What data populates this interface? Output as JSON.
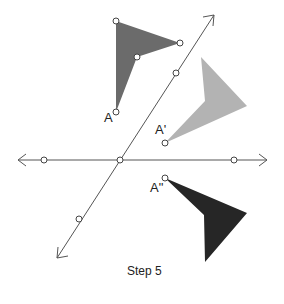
{
  "caption": "Step 5",
  "labels": {
    "a": "A",
    "a_prime": "A'",
    "a_double_prime": "A\""
  },
  "colors": {
    "original_shape": "#6b6b6b",
    "first_image": "#b3b3b3",
    "second_image": "#262626",
    "lines": "#555555"
  },
  "shapes": {
    "original": {
      "points": "116,21 180,43 137,57 116,112"
    },
    "first_reflection": {
      "points": "201,57 247,106 165,143 205,101"
    },
    "second_reflection": {
      "points": "165,178 247,213 205,262 204,215"
    }
  },
  "lines": {
    "horizontal": {
      "x1": 18,
      "y1": 160,
      "x2": 267,
      "y2": 160
    },
    "diagonal": {
      "x1": 57,
      "y1": 258,
      "x2": 214,
      "y2": 15
    }
  },
  "points": [
    {
      "x": 116,
      "y": 21
    },
    {
      "x": 180,
      "y": 43
    },
    {
      "x": 137,
      "y": 57
    },
    {
      "x": 116,
      "y": 112
    },
    {
      "x": 176,
      "y": 73
    },
    {
      "x": 120,
      "y": 160
    },
    {
      "x": 79,
      "y": 219
    },
    {
      "x": 44,
      "y": 160
    },
    {
      "x": 234,
      "y": 160
    },
    {
      "x": 165,
      "y": 143
    },
    {
      "x": 165,
      "y": 178
    }
  ]
}
